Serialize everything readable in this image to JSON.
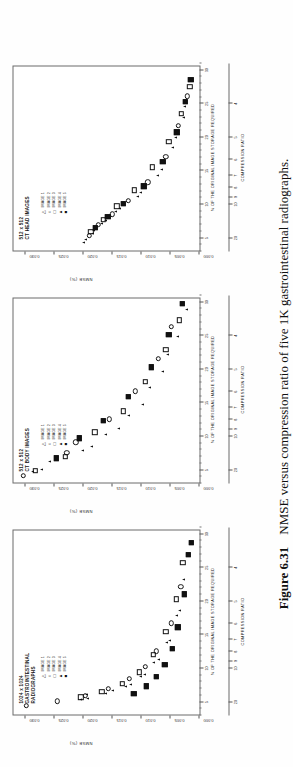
{
  "caption": {
    "figure_number": "Figure 6.31",
    "text": "NMSE versus compression ratio of five 1K gastrointestinal radiographs."
  },
  "axes_common": {
    "ylabel": "NMSE (%)",
    "xlabel_top": "% OF THE ORIGINAL IMAGE STORAGE REQUIRED",
    "xlabel_bottom": "COMPRESSION RATIO",
    "yticks": [
      "0.000",
      "0.005",
      "0.010",
      "0.015",
      "0.020",
      "0.025",
      "0.030"
    ],
    "ylim": [
      0.0,
      0.032
    ],
    "storage_ticks": [
      "5",
      "10",
      "15",
      "20",
      "25",
      "30"
    ],
    "ratio_ticks": [
      "20",
      "10",
      "9",
      "8",
      "7",
      "6",
      "5",
      "4"
    ],
    "legend": [
      {
        "symbol": "triangle-open",
        "glyph": "△",
        "label": "IMAGE 1"
      },
      {
        "symbol": "circle-open",
        "glyph": "○",
        "label": "IMAGE 2"
      },
      {
        "symbol": "square-open",
        "glyph": "□",
        "label": "IMAGE 3"
      },
      {
        "symbol": "triangle-filled",
        "glyph": "▲",
        "label": "IMAGE 4"
      },
      {
        "symbol": "square-filled",
        "glyph": "■",
        "label": "IMAGE 5"
      }
    ]
  },
  "chart_data": [
    {
      "type": "scatter",
      "title": "1024 x 1024\nGASTROINTESTINAL\nRADIOGRAPHS",
      "xlabel": "% OF THE ORIGINAL IMAGE STORAGE REQUIRED",
      "ylabel": "NMSE (%)",
      "xlim": [
        3.0,
        31.0
      ],
      "ylim": [
        0.0,
        0.032
      ],
      "grid": false,
      "legend_position": "top-left",
      "series": [
        {
          "name": "IMAGE 1",
          "symbol": "triangle-open",
          "points": [
            [
              5.2,
              0.0205
            ],
            [
              6.0,
              0.0195
            ],
            [
              6.6,
              0.015
            ],
            [
              7.4,
              0.0118
            ],
            [
              8.9,
              0.0095
            ],
            [
              11.2,
              0.0071
            ],
            [
              14.0,
              0.0052
            ],
            [
              18.5,
              0.0034
            ]
          ]
        },
        {
          "name": "IMAGE 2",
          "symbol": "circle-open",
          "points": [
            [
              4.3,
              0.0298
            ],
            [
              5.0,
              0.0245
            ],
            [
              5.8,
              0.0196
            ],
            [
              6.8,
              0.0157
            ],
            [
              8.3,
              0.0121
            ],
            [
              10.1,
              0.0093
            ],
            [
              12.4,
              0.0074
            ],
            [
              16.6,
              0.0049
            ],
            [
              22.0,
              0.0032
            ]
          ]
        },
        {
          "name": "IMAGE 3",
          "symbol": "square-open",
          "points": [
            [
              5.6,
              0.0204
            ],
            [
              6.4,
              0.0168
            ],
            [
              7.6,
              0.0133
            ],
            [
              9.3,
              0.0104
            ],
            [
              11.9,
              0.008
            ],
            [
              15.3,
              0.0058
            ],
            [
              20.2,
              0.004
            ],
            [
              25.6,
              0.0029
            ]
          ]
        },
        {
          "name": "IMAGE 4",
          "symbol": "triangle-filled",
          "points": [
            [
              5.4,
              0.0193
            ],
            [
              6.2,
              0.0161
            ],
            [
              7.1,
              0.0128
            ],
            [
              8.7,
              0.0101
            ],
            [
              10.8,
              0.0079
            ],
            [
              13.7,
              0.0057
            ],
            [
              17.8,
              0.0039
            ],
            [
              23.1,
              0.0027
            ]
          ]
        },
        {
          "name": "IMAGE 5",
          "symbol": "square-filled",
          "points": [
            [
              6.1,
              0.0113
            ],
            [
              7.2,
              0.0091
            ],
            [
              8.6,
              0.0074
            ],
            [
              10.4,
              0.006
            ],
            [
              12.8,
              0.0047
            ],
            [
              16.0,
              0.0037
            ],
            [
              20.9,
              0.0026
            ],
            [
              26.8,
              0.0019
            ],
            [
              28.6,
              0.0014
            ]
          ]
        }
      ]
    },
    {
      "type": "scatter",
      "title": "512 x 512\nCT BODY IMAGES",
      "xlabel": "% OF THE ORIGINAL IMAGE STORAGE REQUIRED",
      "ylabel": "NMSE (%)",
      "xlim": [
        3.0,
        31.0
      ],
      "ylim": [
        0.0,
        0.032
      ],
      "grid": false,
      "legend_position": "top-left",
      "series": [
        {
          "name": "IMAGE 1",
          "symbol": "triangle-open",
          "points": [
            [
              4.6,
              0.0288
            ],
            [
              6.2,
              0.0258
            ],
            [
              8.4,
              0.0186
            ],
            [
              11.0,
              0.014
            ],
            [
              14.6,
              0.0098
            ],
            [
              19.6,
              0.0064
            ],
            [
              24.8,
              0.0038
            ]
          ]
        },
        {
          "name": "IMAGE 2",
          "symbol": "circle-open",
          "points": [
            [
              4.0,
              0.0303
            ],
            [
              7.4,
              0.0228
            ],
            [
              9.0,
              0.0213
            ],
            [
              12.4,
              0.0155
            ],
            [
              16.6,
              0.011
            ],
            [
              21.4,
              0.0071
            ],
            [
              26.2,
              0.0048
            ]
          ]
        },
        {
          "name": "IMAGE 3",
          "symbol": "square-open",
          "points": [
            [
              4.8,
              0.0283
            ],
            [
              6.8,
              0.0231
            ],
            [
              10.5,
              0.018
            ],
            [
              13.6,
              0.0131
            ],
            [
              18.0,
              0.0093
            ],
            [
              22.8,
              0.0058
            ],
            [
              27.2,
              0.0035
            ]
          ]
        },
        {
          "name": "IMAGE 4",
          "symbol": "triangle-filled",
          "points": [
            [
              5.0,
              0.0272
            ],
            [
              7.8,
              0.0202
            ],
            [
              10.2,
              0.0162
            ],
            [
              13.0,
              0.0123
            ],
            [
              17.2,
              0.0086
            ],
            [
              22.0,
              0.0055
            ],
            [
              28.8,
              0.0022
            ]
          ]
        },
        {
          "name": "IMAGE 5",
          "symbol": "square-filled",
          "points": [
            [
              6.6,
              0.0246
            ],
            [
              9.6,
              0.0207
            ],
            [
              12.2,
              0.0166
            ],
            [
              15.8,
              0.0122
            ],
            [
              20.2,
              0.0083
            ],
            [
              25.0,
              0.0053
            ],
            [
              29.6,
              0.003
            ]
          ]
        }
      ]
    },
    {
      "type": "scatter",
      "title": "512 x 512\nCT HEAD IMAGES",
      "xlabel": "% OF THE ORIGINAL IMAGE STORAGE REQUIRED",
      "ylabel": "NMSE (%)",
      "xlim": [
        3.0,
        31.0
      ],
      "ylim": [
        0.0,
        0.032
      ],
      "grid": false,
      "legend_position": "top-left",
      "series": [
        {
          "name": "IMAGE 1",
          "symbol": "triangle-open",
          "points": [
            [
              4.6,
              0.0196
            ],
            [
              6.0,
              0.0182
            ],
            [
              7.4,
              0.0161
            ],
            [
              9.2,
              0.0137
            ],
            [
              11.6,
              0.0101
            ],
            [
              15.0,
              0.0066
            ],
            [
              19.8,
              0.0042
            ],
            [
              24.4,
              0.0026
            ]
          ]
        },
        {
          "name": "IMAGE 2",
          "symbol": "circle-open",
          "points": [
            [
              5.2,
              0.019
            ],
            [
              6.8,
              0.0174
            ],
            [
              8.4,
              0.015
            ],
            [
              10.4,
              0.0122
            ],
            [
              13.2,
              0.0089
            ],
            [
              17.0,
              0.0058
            ],
            [
              21.6,
              0.0036
            ],
            [
              26.0,
              0.0021
            ]
          ]
        },
        {
          "name": "IMAGE 3",
          "symbol": "square-open",
          "points": [
            [
              5.8,
              0.0187
            ],
            [
              7.6,
              0.0166
            ],
            [
              9.6,
              0.0142
            ],
            [
              12.0,
              0.0112
            ],
            [
              15.4,
              0.0081
            ],
            [
              19.2,
              0.0053
            ],
            [
              23.4,
              0.0031
            ],
            [
              27.4,
              0.0017
            ]
          ]
        },
        {
          "name": "IMAGE 4",
          "symbol": "triangle-filled",
          "points": [
            [
              4.2,
              0.02
            ],
            [
              5.6,
              0.0184
            ],
            [
              7.0,
              0.0168
            ],
            [
              8.8,
              0.0145
            ],
            [
              11.0,
              0.0106
            ],
            [
              14.2,
              0.0072
            ],
            [
              18.4,
              0.0046
            ],
            [
              22.8,
              0.0028
            ]
          ]
        },
        {
          "name": "IMAGE 5",
          "symbol": "square-filled",
          "points": [
            [
              6.4,
              0.0179
            ],
            [
              8.0,
              0.0158
            ],
            [
              10.0,
              0.0131
            ],
            [
              12.6,
              0.0096
            ],
            [
              16.2,
              0.0063
            ],
            [
              20.6,
              0.0039
            ],
            [
              25.2,
              0.0024
            ],
            [
              28.4,
              0.0015
            ]
          ]
        }
      ]
    }
  ]
}
